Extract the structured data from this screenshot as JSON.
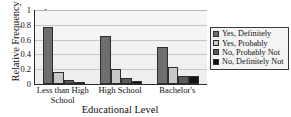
{
  "chart_data": {
    "type": "bar",
    "title": "",
    "xlabel": "Educational Level",
    "ylabel": "Relative Frequency",
    "categories": [
      "Less than High School",
      "High School",
      "Bachelor's"
    ],
    "series": [
      {
        "name": "Yes, Definitely",
        "color": "#6e6e6e",
        "values": [
          0.765,
          0.655,
          0.5
        ]
      },
      {
        "name": "Yes, Probably",
        "color": "#c8c8c8",
        "values": [
          0.165,
          0.2,
          0.235
        ]
      },
      {
        "name": "No, Probably Not",
        "color": "#5a5a5a",
        "values": [
          0.055,
          0.08,
          0.11
        ]
      },
      {
        "name": "No, Definitely Not",
        "color": "#111111",
        "values": [
          0.025,
          0.04,
          0.11
        ]
      }
    ],
    "ylim": [
      0,
      1
    ],
    "yticks": [
      "0",
      "0.2",
      "0.4",
      "0.6",
      "0.8",
      "1"
    ],
    "ytick_values": [
      0,
      0.2,
      0.4,
      0.6,
      0.8,
      1
    ],
    "grid": true,
    "legend_position": "right",
    "plot_background": "#f2f2f2",
    "gridline_color": "#c5c5c5",
    "axis_color": "#2b2b2b"
  },
  "legend": {
    "items": [
      {
        "label": "Yes, Definitely"
      },
      {
        "label": "Yes, Probably"
      },
      {
        "label": "No, Probably Not"
      },
      {
        "label": "No, Definitely Not"
      }
    ]
  }
}
